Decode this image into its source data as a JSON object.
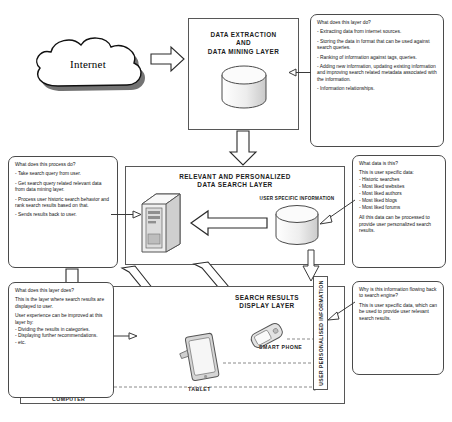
{
  "diagram": {
    "source_label": "Internet",
    "layers": {
      "extraction": {
        "title": "DATA EXTRACTION\nAND\nDATA MINING LAYER",
        "store_icon": "database-cylinder-icon"
      },
      "search": {
        "title": "RELEVANT AND PERSONALIZED\nDATA SEARCH LAYER",
        "server_icon": "server-tower-icon",
        "user_store_label": "USER SPECIFIC INFORMATION",
        "user_store_icon": "database-cylinder-icon"
      },
      "display": {
        "title": "SEARCH RESULTS\nDISPLAY LAYER",
        "devices": [
          {
            "label": "SMART PHONE",
            "icon": "smartphone-icon"
          },
          {
            "label": "TABLET",
            "icon": "tablet-icon"
          },
          {
            "label": "COMPUTER",
            "icon": "laptop-computer-icon"
          }
        ]
      }
    },
    "feedback_band": {
      "label": "USER PERSONALISED INFORMATION"
    },
    "callouts": {
      "extraction": {
        "question": "What does this layer do?",
        "items": [
          "- Extracting data from internet sources.",
          "- Storing the data in format that can be used against search queries.",
          "- Ranking of information against tags, queries.",
          "- Adding new information, updating existing information and improving search related metadata associated with the information.",
          "- Information relationships."
        ]
      },
      "search_process": {
        "question": "What does this process do?",
        "items": [
          "- Take search query from user.",
          "- Get search query related relevant data from data mining layer.",
          "- Process user historic search behavior and rank search results based on that.",
          "- Sends results back to user."
        ]
      },
      "user_data": {
        "question": "What data is this?",
        "intro": "This is user specific data:",
        "items": [
          "- Historic searches",
          "- Most liked websites",
          "- Most liked authors",
          "- Most liked blogs",
          "- Most liked forums"
        ],
        "note": "All this data can be processed to provide user personalized search results."
      },
      "display_layer": {
        "question": "What does this layer does?",
        "intro": "This is the layer where search results are displayed to user.",
        "subhead": "User experience can be improved at this layer by:",
        "items": [
          "- Dividing the results in categories.",
          "- Displaying further recommendations.",
          "- etc."
        ]
      },
      "feedback": {
        "question": "Why is this information flowing back to search engine?",
        "note": "This is user specific data, which can be used to provide user relevant search results."
      }
    },
    "colors": {
      "stroke": "#575757",
      "text": "#1b1b1b",
      "fill": "#ffffff",
      "shade": "#d9d9d9"
    }
  }
}
